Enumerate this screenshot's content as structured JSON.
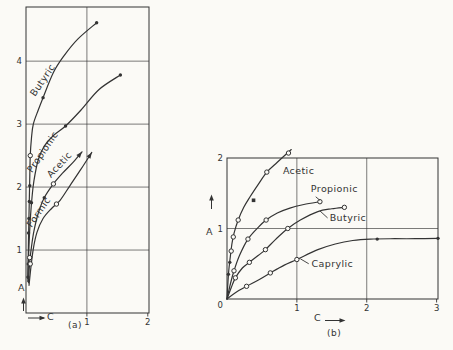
{
  "figure": {
    "background": "#fbfaf6",
    "ink": "#333333"
  },
  "chart_data": [
    {
      "id": "a",
      "type": "line",
      "caption": "(a)",
      "xlabel": "C",
      "ylabel": "A",
      "xlim": [
        0,
        2.02
      ],
      "ylim": [
        0,
        4.86
      ],
      "grid_on": true,
      "xticks": [
        {
          "v": 1,
          "label": "1"
        },
        {
          "v": 2,
          "label": "2"
        }
      ],
      "yticks": [
        {
          "v": 1,
          "label": "1"
        },
        {
          "v": 2,
          "label": "2"
        },
        {
          "v": 3,
          "label": "3"
        },
        {
          "v": 4,
          "label": "4"
        }
      ],
      "grid": {
        "x": [
          1
        ],
        "y": [
          1,
          2,
          3,
          4
        ]
      },
      "series": [
        {
          "name": "Butyric",
          "label": {
            "text": "Butyric",
            "x": 0.15,
            "y": 3.43,
            "rot": -56
          },
          "points": [
            [
              0.03,
              0.55
            ],
            [
              0.04,
              1.1
            ],
            [
              0.05,
              1.6
            ],
            [
              0.06,
              2.05
            ],
            [
              0.07,
              2.5
            ],
            [
              0.09,
              2.78
            ],
            [
              0.12,
              3.0
            ],
            [
              0.2,
              3.22
            ],
            [
              0.28,
              3.42
            ],
            [
              0.45,
              3.82
            ],
            [
              0.62,
              4.08
            ],
            [
              0.85,
              4.35
            ],
            [
              1.16,
              4.61
            ]
          ],
          "markers": [
            {
              "x": 0.042,
              "y": 1.27,
              "t": "d"
            },
            {
              "x": 0.048,
              "y": 1.5,
              "t": "d"
            },
            {
              "x": 0.055,
              "y": 1.77,
              "t": "d"
            },
            {
              "x": 0.062,
              "y": 2.02,
              "t": "d"
            },
            {
              "x": 0.07,
              "y": 2.5,
              "t": "o"
            },
            {
              "x": 0.28,
              "y": 3.42,
              "t": "d"
            },
            {
              "x": 1.16,
              "y": 4.61,
              "t": "d"
            }
          ],
          "end_arrow": false
        },
        {
          "name": "Propionic",
          "label": {
            "text": "Propionic",
            "x": 0.1,
            "y": 2.22,
            "rot": -56
          },
          "points": [
            [
              0.03,
              0.5
            ],
            [
              0.04,
              0.85
            ],
            [
              0.055,
              1.2
            ],
            [
              0.075,
              1.55
            ],
            [
              0.1,
              1.85
            ],
            [
              0.13,
              2.1
            ],
            [
              0.2,
              2.43
            ],
            [
              0.3,
              2.65
            ],
            [
              0.45,
              2.82
            ],
            [
              0.65,
              2.97
            ],
            [
              0.9,
              3.22
            ],
            [
              1.2,
              3.55
            ],
            [
              1.55,
              3.78
            ]
          ],
          "markers": [
            {
              "x": 0.032,
              "y": 0.57,
              "t": "d"
            },
            {
              "x": 0.037,
              "y": 0.78,
              "t": "d"
            },
            {
              "x": 0.09,
              "y": 1.75,
              "t": "d"
            },
            {
              "x": 0.65,
              "y": 2.97,
              "t": "d"
            },
            {
              "x": 1.55,
              "y": 3.78,
              "t": "d"
            }
          ],
          "end_arrow": false
        },
        {
          "name": "Acetic",
          "label": {
            "text": "Acetic",
            "x": 0.41,
            "y": 2.14,
            "rot": -47
          },
          "points": [
            [
              0.04,
              0.48
            ],
            [
              0.06,
              0.8
            ],
            [
              0.09,
              1.05
            ],
            [
              0.13,
              1.3
            ],
            [
              0.2,
              1.58
            ],
            [
              0.3,
              1.83
            ],
            [
              0.45,
              2.05
            ],
            [
              0.6,
              2.22
            ],
            [
              0.78,
              2.4
            ],
            [
              0.92,
              2.56
            ]
          ],
          "markers": [
            {
              "x": 0.06,
              "y": 0.88,
              "t": "o"
            },
            {
              "x": 0.3,
              "y": 1.83,
              "t": "d"
            },
            {
              "x": 0.45,
              "y": 2.05,
              "t": "o"
            }
          ],
          "end_arrow": true
        },
        {
          "name": "Formic",
          "label": {
            "text": "Formic",
            "x": 0.09,
            "y": 1.35,
            "rot": -55
          },
          "points": [
            [
              0.05,
              0.44
            ],
            [
              0.08,
              0.72
            ],
            [
              0.12,
              1.02
            ],
            [
              0.18,
              1.28
            ],
            [
              0.28,
              1.5
            ],
            [
              0.42,
              1.66
            ],
            [
              0.56,
              1.79
            ],
            [
              0.72,
              2.02
            ],
            [
              0.9,
              2.28
            ],
            [
              1.08,
              2.55
            ]
          ],
          "markers": [
            {
              "x": 0.07,
              "y": 0.78,
              "t": "o"
            },
            {
              "x": 0.5,
              "y": 1.73,
              "t": "o"
            }
          ],
          "end_arrow": true
        }
      ]
    },
    {
      "id": "b",
      "type": "line",
      "caption": "(b)",
      "xlabel": "C",
      "ylabel": "A",
      "origin_label": "0",
      "xlim": [
        0,
        3.02
      ],
      "ylim": [
        0,
        2.0
      ],
      "grid_on": true,
      "xticks": [
        {
          "v": 1,
          "label": "1"
        },
        {
          "v": 2,
          "label": "2"
        },
        {
          "v": 3,
          "label": "3"
        }
      ],
      "yticks": [
        {
          "v": 1,
          "label": "1"
        },
        {
          "v": 2,
          "label": "2"
        }
      ],
      "grid": {
        "x": [
          1,
          2
        ],
        "y": [
          1
        ]
      },
      "series": [
        {
          "name": "Acetic",
          "label": {
            "text": "Acetic",
            "x": 0.8,
            "y": 1.77,
            "rot": 0
          },
          "points": [
            [
              0,
              0
            ],
            [
              0.01,
              0.18
            ],
            [
              0.025,
              0.4
            ],
            [
              0.045,
              0.58
            ],
            [
              0.07,
              0.78
            ],
            [
              0.1,
              0.93
            ],
            [
              0.16,
              1.12
            ],
            [
              0.24,
              1.3
            ],
            [
              0.33,
              1.45
            ],
            [
              0.45,
              1.63
            ],
            [
              0.57,
              1.8
            ],
            [
              0.72,
              1.94
            ],
            [
              0.92,
              2.12
            ]
          ],
          "markers": [
            {
              "x": 0.02,
              "y": 0.35,
              "t": "d"
            },
            {
              "x": 0.04,
              "y": 0.52,
              "t": "d"
            },
            {
              "x": 0.06,
              "y": 0.68,
              "t": "o"
            },
            {
              "x": 0.09,
              "y": 0.88,
              "t": "o"
            },
            {
              "x": 0.16,
              "y": 1.12,
              "t": "o"
            },
            {
              "x": 0.38,
              "y": 1.4,
              "t": "s"
            },
            {
              "x": 0.57,
              "y": 1.8,
              "t": "o"
            },
            {
              "x": 0.88,
              "y": 2.07,
              "t": "o"
            }
          ],
          "end_arrow": false
        },
        {
          "name": "Propionic",
          "label": {
            "text": "Propionic",
            "x": 1.2,
            "y": 1.52,
            "rot": 0
          },
          "leader": [
            [
              1.27,
              1.45
            ],
            [
              1.33,
              1.4
            ]
          ],
          "points": [
            [
              0,
              0
            ],
            [
              0.05,
              0.22
            ],
            [
              0.1,
              0.4
            ],
            [
              0.18,
              0.62
            ],
            [
              0.3,
              0.85
            ],
            [
              0.45,
              1.02
            ],
            [
              0.56,
              1.12
            ],
            [
              0.72,
              1.22
            ],
            [
              0.9,
              1.29
            ],
            [
              1.1,
              1.34
            ],
            [
              1.33,
              1.38
            ]
          ],
          "markers": [
            {
              "x": 0.1,
              "y": 0.4,
              "t": "o"
            },
            {
              "x": 0.3,
              "y": 0.85,
              "t": "o"
            },
            {
              "x": 0.56,
              "y": 1.12,
              "t": "o"
            },
            {
              "x": 1.33,
              "y": 1.38,
              "t": "o"
            }
          ],
          "end_arrow": false
        },
        {
          "name": "Butyric",
          "label": {
            "text": "Butyric",
            "x": 1.47,
            "y": 1.1,
            "rot": 0
          },
          "leader": [
            [
              1.44,
              1.15
            ],
            [
              1.33,
              1.25
            ]
          ],
          "points": [
            [
              0,
              0
            ],
            [
              0.06,
              0.16
            ],
            [
              0.12,
              0.3
            ],
            [
              0.22,
              0.44
            ],
            [
              0.32,
              0.52
            ],
            [
              0.45,
              0.62
            ],
            [
              0.55,
              0.7
            ],
            [
              0.7,
              0.85
            ],
            [
              0.87,
              1.0
            ],
            [
              1.05,
              1.12
            ],
            [
              1.3,
              1.24
            ],
            [
              1.5,
              1.28
            ],
            [
              1.68,
              1.3
            ]
          ],
          "markers": [
            {
              "x": 0.12,
              "y": 0.3,
              "t": "o"
            },
            {
              "x": 0.32,
              "y": 0.52,
              "t": "o"
            },
            {
              "x": 0.55,
              "y": 0.7,
              "t": "o"
            },
            {
              "x": 0.87,
              "y": 1.0,
              "t": "o"
            },
            {
              "x": 1.68,
              "y": 1.3,
              "t": "o"
            }
          ],
          "end_arrow": false
        },
        {
          "name": "Caprylic",
          "label": {
            "text": "Caprylic",
            "x": 1.21,
            "y": 0.46,
            "rot": 0
          },
          "leader": [
            [
              1.17,
              0.5
            ],
            [
              1.05,
              0.57
            ]
          ],
          "points": [
            [
              0,
              0
            ],
            [
              0.12,
              0.09
            ],
            [
              0.28,
              0.18
            ],
            [
              0.45,
              0.27
            ],
            [
              0.62,
              0.37
            ],
            [
              0.82,
              0.48
            ],
            [
              1.0,
              0.56
            ],
            [
              1.3,
              0.7
            ],
            [
              1.55,
              0.78
            ],
            [
              1.8,
              0.83
            ],
            [
              2.05,
              0.85
            ],
            [
              2.4,
              0.855
            ],
            [
              2.7,
              0.855
            ],
            [
              3.02,
              0.86
            ]
          ],
          "markers": [
            {
              "x": 0.28,
              "y": 0.18,
              "t": "o"
            },
            {
              "x": 0.62,
              "y": 0.37,
              "t": "o"
            },
            {
              "x": 1.0,
              "y": 0.56,
              "t": "o"
            },
            {
              "x": 2.15,
              "y": 0.85,
              "t": "d"
            },
            {
              "x": 3.02,
              "y": 0.86,
              "t": "d"
            }
          ],
          "end_arrow": false
        }
      ]
    }
  ]
}
